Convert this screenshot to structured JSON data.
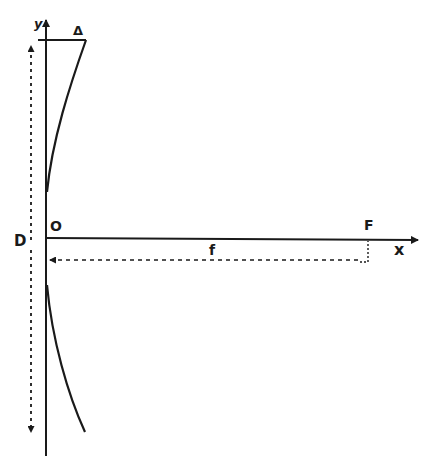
{
  "diagram": {
    "labels": {
      "y_axis": "y",
      "x_axis": "x",
      "origin": "O",
      "focus": "F",
      "focal_length": "f",
      "diameter": "D",
      "deviation": "Δ"
    },
    "colors": {
      "ink": "#1a1a1a",
      "background": "#ffffff"
    }
  }
}
